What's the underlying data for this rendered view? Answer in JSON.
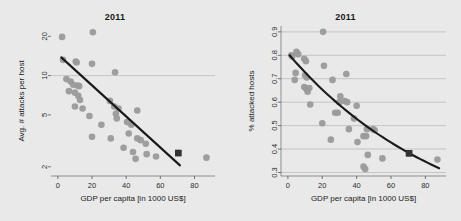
{
  "figure": {
    "background_color": "#e9e9e9",
    "page_background": "#ffffff",
    "point_color": "#9a9a9a",
    "highlight_color": "#333333",
    "fit_line_color": "#1a1a1a",
    "grid_color": "#b6b6b6"
  },
  "panels": [
    {
      "id": "left",
      "title": "2011",
      "xlabel": "GDP per capita [in 1000 US$]",
      "ylabel": "Avg. # attacks per host"
    },
    {
      "id": "right",
      "title": "2011",
      "xlabel": "GDP per capita [in 1000 US$]",
      "ylabel": "% attacked hosts"
    }
  ],
  "chart_data": [
    {
      "type": "scatter",
      "title": "2011",
      "xlabel": "GDP per capita [in 1000 US$]",
      "ylabel": "Avg. # attacks per host",
      "xlim": [
        -4,
        92
      ],
      "ylim": [
        1.7,
        24
      ],
      "yscale": "log",
      "xticks": [
        0,
        20,
        40,
        60,
        80
      ],
      "yticks": [
        2,
        5,
        10,
        20
      ],
      "xtick_labels": [
        "0",
        "20",
        "40",
        "60",
        "80"
      ],
      "ytick_labels": [
        "2",
        "5",
        "10",
        "20"
      ],
      "grid": "horizontal-at-10-only",
      "legend": "none",
      "series": [
        {
          "name": "countries",
          "marker": "circle",
          "color": "#9a9a9a",
          "points": [
            [
              2.5,
              19.8
            ],
            [
              20.5,
              21.5
            ],
            [
              3.0,
              13.2
            ],
            [
              10.5,
              12.8
            ],
            [
              11.0,
              12.6
            ],
            [
              20.0,
              12.3
            ],
            [
              33.5,
              10.6
            ],
            [
              5.0,
              9.4
            ],
            [
              7.5,
              9.0
            ],
            [
              9.0,
              8.5
            ],
            [
              11.5,
              8.4
            ],
            [
              12.5,
              8.3
            ],
            [
              6.5,
              7.6
            ],
            [
              10.0,
              7.4
            ],
            [
              12.0,
              7.0
            ],
            [
              13.0,
              6.5
            ],
            [
              10.0,
              5.8
            ],
            [
              14.5,
              5.6
            ],
            [
              30.5,
              6.4
            ],
            [
              33.0,
              5.8
            ],
            [
              35.5,
              5.6
            ],
            [
              46.5,
              5.4
            ],
            [
              18.5,
              4.9
            ],
            [
              34.0,
              5.1
            ],
            [
              34.5,
              4.7
            ],
            [
              25.5,
              4.2
            ],
            [
              40.5,
              4.4
            ],
            [
              43.0,
              4.2
            ],
            [
              20.0,
              3.4
            ],
            [
              31.0,
              3.3
            ],
            [
              41.5,
              3.6
            ],
            [
              46.5,
              3.3
            ],
            [
              48.5,
              3.2
            ],
            [
              51.5,
              3.0
            ],
            [
              38.5,
              2.8
            ],
            [
              44.0,
              2.6
            ],
            [
              45.5,
              2.3
            ],
            [
              52.0,
              2.5
            ],
            [
              57.5,
              2.4
            ],
            [
              87.0,
              2.35
            ]
          ]
        },
        {
          "name": "highlighted country",
          "marker": "square",
          "color": "#333333",
          "points": [
            [
              70.5,
              2.55
            ]
          ]
        }
      ],
      "fit_line": {
        "style": "solid",
        "color": "#1a1a1a",
        "x_start": 2.0,
        "x_end": 71.5,
        "y_start": 13.8,
        "y_end": 2.05
      }
    },
    {
      "type": "scatter",
      "title": "2011",
      "xlabel": "GDP per capita [in 1000 US$]",
      "ylabel": "% attacked hosts",
      "xlim": [
        -4,
        92
      ],
      "ylim": [
        0.285,
        0.925
      ],
      "yscale": "linear",
      "xticks": [
        0,
        20,
        40,
        60,
        80
      ],
      "yticks": [
        0.3,
        0.4,
        0.5,
        0.6,
        0.7,
        0.8,
        0.9
      ],
      "xtick_labels": [
        "0",
        "20",
        "40",
        "60",
        "80"
      ],
      "ytick_labels": [
        "0.3",
        "0.4",
        "0.5",
        "0.6",
        "0.7",
        "0.8",
        "0.9"
      ],
      "grid": "horizontal",
      "legend": "none",
      "series": [
        {
          "name": "countries",
          "marker": "circle",
          "color": "#9a9a9a",
          "points": [
            [
              20.5,
              0.9
            ],
            [
              2.0,
              0.8
            ],
            [
              2.5,
              0.795
            ],
            [
              5.0,
              0.815
            ],
            [
              6.0,
              0.805
            ],
            [
              9.5,
              0.785
            ],
            [
              10.5,
              0.775
            ],
            [
              21.0,
              0.755
            ],
            [
              4.5,
              0.725
            ],
            [
              10.0,
              0.715
            ],
            [
              11.0,
              0.705
            ],
            [
              26.0,
              0.695
            ],
            [
              34.0,
              0.72
            ],
            [
              4.0,
              0.695
            ],
            [
              9.5,
              0.665
            ],
            [
              10.5,
              0.66
            ],
            [
              11.0,
              0.655
            ],
            [
              12.5,
              0.66
            ],
            [
              11.5,
              0.645
            ],
            [
              30.5,
              0.625
            ],
            [
              13.0,
              0.59
            ],
            [
              30.0,
              0.6
            ],
            [
              33.0,
              0.605
            ],
            [
              34.5,
              0.6
            ],
            [
              40.0,
              0.585
            ],
            [
              27.5,
              0.555
            ],
            [
              29.0,
              0.555
            ],
            [
              38.5,
              0.53
            ],
            [
              20.0,
              0.51
            ],
            [
              35.5,
              0.485
            ],
            [
              46.0,
              0.485
            ],
            [
              49.5,
              0.485
            ],
            [
              50.5,
              0.48
            ],
            [
              25.0,
              0.44
            ],
            [
              40.5,
              0.43
            ],
            [
              44.0,
              0.455
            ],
            [
              45.5,
              0.455
            ],
            [
              46.5,
              0.375
            ],
            [
              55.0,
              0.36
            ],
            [
              44.0,
              0.325
            ],
            [
              45.0,
              0.315
            ],
            [
              87.0,
              0.355
            ]
          ]
        },
        {
          "name": "highlighted country",
          "marker": "square",
          "color": "#333333",
          "points": [
            [
              70.5,
              0.382
            ]
          ]
        }
      ],
      "fit_line": {
        "style": "solid-curve",
        "color": "#1a1a1a",
        "x_start": 1.0,
        "x_end": 88.0,
        "y_start": 0.8,
        "y_end": 0.318,
        "curve": "exponential-decay"
      }
    }
  ]
}
